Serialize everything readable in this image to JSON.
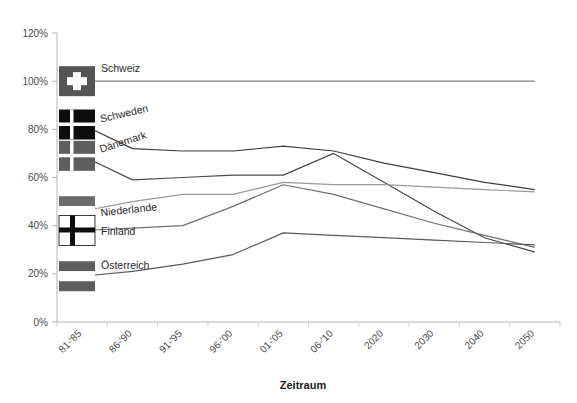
{
  "chart_data": {
    "type": "line",
    "title": "",
    "xlabel": "Zeitraum",
    "ylabel": "",
    "categories": [
      "81-'85",
      "86-'90",
      "91-'95",
      "96-'00",
      "01-'05",
      "06-'10",
      "2020",
      "2030",
      "2040",
      "2050"
    ],
    "ylim": [
      0,
      120
    ],
    "ytick_labels": [
      "0%",
      "20%",
      "40%",
      "60%",
      "80%",
      "100%",
      "120%"
    ],
    "ytick_values": [
      0,
      20,
      40,
      60,
      80,
      100,
      120
    ],
    "grid": false,
    "legend": "inline-flag-markers-left",
    "series": [
      {
        "name": "Schweiz",
        "color": "#7f7f7f",
        "values": [
          100,
          100,
          100,
          100,
          100,
          100,
          100,
          100,
          100,
          100
        ]
      },
      {
        "name": "Schweden",
        "color": "#3f3f3f",
        "values": [
          82,
          72,
          71,
          71,
          73,
          71,
          66,
          62,
          58,
          55
        ]
      },
      {
        "name": "Dänemark",
        "color": "#4a4a4a",
        "values": [
          69,
          59,
          60,
          61,
          61,
          70,
          58,
          46,
          35,
          29
        ]
      },
      {
        "name": "Niederlande",
        "color": "#9a9a9a",
        "values": [
          46,
          50,
          53,
          53,
          58,
          57,
          57,
          56,
          55,
          54
        ]
      },
      {
        "name": "Finland",
        "color": "#6f6f6f",
        "values": [
          38,
          39,
          40,
          48,
          57,
          53,
          47,
          41,
          36,
          31
        ]
      },
      {
        "name": "Österreich",
        "color": "#5a5a5a",
        "values": [
          19,
          21,
          24,
          28,
          37,
          36,
          35,
          34,
          33,
          32
        ]
      }
    ]
  },
  "axis": {
    "x_title": "Zeitraum"
  },
  "legend_markers": [
    {
      "name": "Schweiz",
      "flag": "swiss-flag-icon",
      "label": "Schweiz"
    },
    {
      "name": "Schweden",
      "flag": "sweden-flag-icon",
      "label": "Schweden"
    },
    {
      "name": "Dänemark",
      "flag": "denmark-flag-icon",
      "label": "Dänemark"
    },
    {
      "name": "Niederlande",
      "flag": "netherlands-flag-icon",
      "label": "Niederlande"
    },
    {
      "name": "Finland",
      "flag": "finland-flag-icon",
      "label": "Finland"
    },
    {
      "name": "Österreich",
      "flag": "austria-flag-icon",
      "label": "Österreich"
    }
  ],
  "colors": {
    "axis": "#b5b5b5",
    "text": "#4a4a4a",
    "title_text": "#1a1a1a"
  }
}
